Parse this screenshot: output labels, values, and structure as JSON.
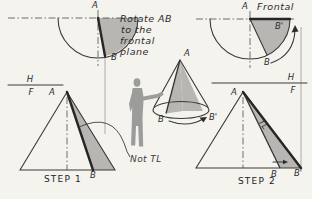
{
  "colors": {
    "background": "#f4f3ee",
    "line": "#3a3a3a",
    "shading": "#b7b6b2",
    "figure_silhouette": "#9c9c9a"
  },
  "annotation": {
    "line1": "Rotate AB",
    "line2": "to the",
    "line3": "frontal",
    "line4": "plane"
  },
  "step1": {
    "top_view": {
      "label_a": "A",
      "label_b": "B"
    },
    "fold_line": {
      "above": "H",
      "below": "F"
    },
    "front_view": {
      "label_a": "A",
      "label_b": "B",
      "note": "Not TL",
      "caption": "STEP 1"
    }
  },
  "pictorial": {
    "label_a": "A",
    "label_b": "B",
    "label_b_prime": "B'"
  },
  "step2": {
    "top_view": {
      "label_a": "A",
      "label_b": "B",
      "label_b_prime": "B'",
      "plane_label": "Frontal"
    },
    "fold_line": {
      "above": "H",
      "below": "F"
    },
    "front_view": {
      "label_a": "A",
      "label_b": "B",
      "label_b_prime": "B'",
      "true_length": "TL",
      "caption": "STEP 2"
    }
  }
}
